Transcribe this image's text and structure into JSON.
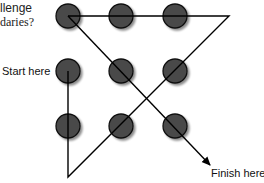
{
  "title": {
    "line1": "llenge",
    "line2": "daries?"
  },
  "labels": {
    "start": "Start here",
    "finish": "Finish here"
  },
  "colors": {
    "dot_fill": "#4a4a4a",
    "dot_stroke": "#111111",
    "line": "#000000"
  },
  "dots": [
    {
      "row": 1,
      "col": 1
    },
    {
      "row": 1,
      "col": 2
    },
    {
      "row": 1,
      "col": 3
    },
    {
      "row": 2,
      "col": 1
    },
    {
      "row": 2,
      "col": 2
    },
    {
      "row": 2,
      "col": 3
    },
    {
      "row": 3,
      "col": 1
    },
    {
      "row": 3,
      "col": 2
    },
    {
      "row": 3,
      "col": 3
    }
  ]
}
